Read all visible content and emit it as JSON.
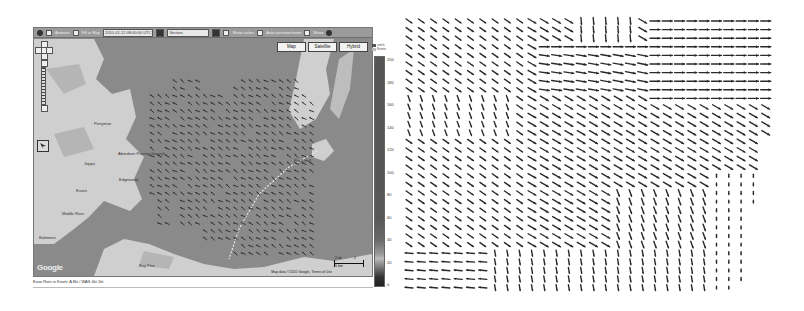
{
  "map": {
    "toolbar": {
      "animate_label": "Animate",
      "fill_label": "Fill in Map",
      "datetime_value": "2010-01-12 08:00:00 UTC",
      "layer_select": "Vectors",
      "show_labels": "Show colors",
      "auto_recenter": "Auto-recenter/zoom",
      "show_label": "Show"
    },
    "map_type_buttons": [
      "Map",
      "Satellite",
      "Hybrid"
    ],
    "google_logo": "Google",
    "attribution": "Map data ©2010 Google, Terms of Use",
    "scale_bar": {
      "top_label": "2 mi",
      "bottom_label": "5 km",
      "right_label": "2"
    },
    "footer": "Ease Rate in Knots: A 8kt / WAS 4kt 1kt",
    "colorbar": {
      "legend": [
        "cm/s",
        "Knots"
      ],
      "labels": [
        "200",
        "180",
        "160",
        "140",
        "120",
        "100",
        "80",
        "60",
        "40",
        "20",
        "0"
      ]
    },
    "place_labels": [
      {
        "text": "Perryman",
        "x": 60,
        "y": 86
      },
      {
        "text": "Aberdeen Proving Ground",
        "x": 84,
        "y": 116
      },
      {
        "text": "Joppa",
        "x": 50,
        "y": 126
      },
      {
        "text": "Edgewood",
        "x": 85,
        "y": 142
      },
      {
        "text": "Essex",
        "x": 42,
        "y": 153
      },
      {
        "text": "Middle River",
        "x": 28,
        "y": 176
      },
      {
        "text": "Rock Hall",
        "x": 260,
        "y": 123
      },
      {
        "text": "Baltimore",
        "x": 5,
        "y": 200
      },
      {
        "text": "Bay Pine",
        "x": 105,
        "y": 228
      },
      {
        "text": "Pasadena",
        "x": 50,
        "y": 245
      }
    ]
  },
  "quiver": {
    "cols": 30,
    "rows": 32,
    "spacing_x": 12.3,
    "spacing_y": 8.6,
    "regions": [
      {
        "name": "upper-left",
        "angle": 35,
        "len": 7
      },
      {
        "name": "top-right-east",
        "angle": 0,
        "len": 10
      },
      {
        "name": "top-middle-south",
        "angle": 85,
        "len": 7
      },
      {
        "name": "center-diagonal",
        "angle": 30,
        "len": 9
      },
      {
        "name": "lower-south",
        "angle": 80,
        "len": 6
      },
      {
        "name": "bottom-left-west",
        "angle": 185,
        "len": 8
      },
      {
        "name": "right-low-weak",
        "angle": 90,
        "len": 3
      }
    ]
  },
  "colors": {
    "water": "#8a8a8a",
    "land": "#cfcfcf",
    "arrow": "#2a2a2a",
    "route": "#e6e6e6"
  }
}
